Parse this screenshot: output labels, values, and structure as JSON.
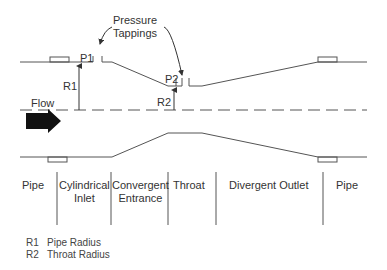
{
  "diagram": {
    "annotations": {
      "pressure_tappings": [
        "Pressure",
        "Tappings"
      ],
      "p1": "P1",
      "p2": "P2",
      "r1": "R1",
      "r2": "R2",
      "flow": "Flow"
    },
    "sections": [
      {
        "line1": "Pipe",
        "line2": ""
      },
      {
        "line1": "Cylindrical",
        "line2": "Inlet"
      },
      {
        "line1": "Convergent",
        "line2": "Entrance"
      },
      {
        "line1": "Throat",
        "line2": ""
      },
      {
        "line1": "Divergent Outlet",
        "line2": ""
      },
      {
        "line1": "Pipe",
        "line2": ""
      }
    ],
    "legend": [
      {
        "key": "R1",
        "text": "Pipe Radius"
      },
      {
        "key": "R2",
        "text": "Throat Radius"
      }
    ],
    "colors": {
      "line": "#555555",
      "arrow": "#111111",
      "text": "#333333"
    }
  }
}
